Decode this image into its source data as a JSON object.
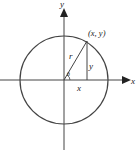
{
  "diagram": {
    "labels": {
      "y_axis": "y",
      "x_axis": "x",
      "point": "(x, y)",
      "radius": "r",
      "opposite_side": "y",
      "adjacent_side": "x",
      "angle": "θ"
    },
    "colors": {
      "stroke": "#333333",
      "background": "#ffffff"
    }
  }
}
